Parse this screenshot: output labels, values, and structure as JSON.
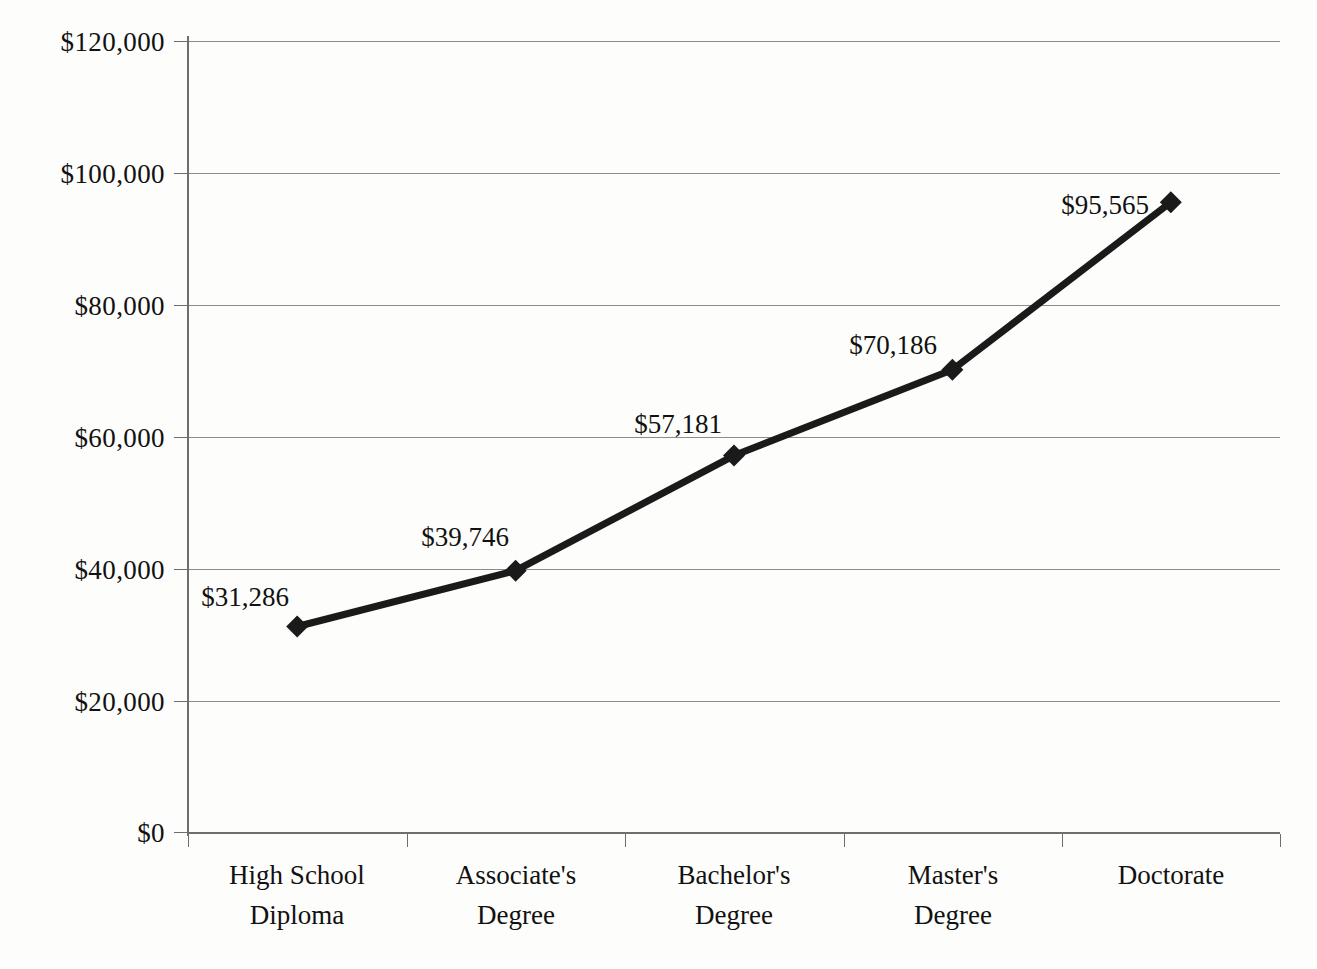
{
  "chart_data": {
    "type": "line",
    "title": "",
    "subtitle": "",
    "xlabel": "",
    "ylabel": "",
    "categories": [
      "High School\nDiploma",
      "Associate's\nDegree",
      "Bachelor's\nDegree",
      "Master's\nDegree",
      "Doctorate"
    ],
    "values": [
      31286,
      39746,
      57181,
      70186,
      95565
    ],
    "point_labels": [
      "$31,286",
      "$39,746",
      "$57,181",
      "$70,186",
      "$95,565"
    ],
    "ylim": [
      0,
      120000
    ],
    "ytick_values": [
      0,
      20000,
      40000,
      60000,
      80000,
      100000,
      120000
    ],
    "ytick_labels": [
      "$0",
      "$20,000",
      "$40,000",
      "$60,000",
      "$80,000",
      "$100,000",
      "$120,000"
    ],
    "grid": true,
    "legend": "none",
    "series_color": "#1a1a1a",
    "grid_color": "#8c8c8c",
    "axis_color": "#6e6e6e",
    "marker": "diamond"
  },
  "axis": {
    "categories": [
      {
        "line1": "High School",
        "line2": "Diploma"
      },
      {
        "line1": "Associate's",
        "line2": "Degree"
      },
      {
        "line1": "Bachelor's",
        "line2": "Degree"
      },
      {
        "line1": "Master's",
        "line2": "Degree"
      },
      {
        "line1": "Doctorate",
        "line2": ""
      }
    ],
    "y_labels": [
      "$120,000",
      "$100,000",
      "$80,000",
      "$60,000",
      "$40,000",
      "$20,000",
      "$0"
    ]
  }
}
